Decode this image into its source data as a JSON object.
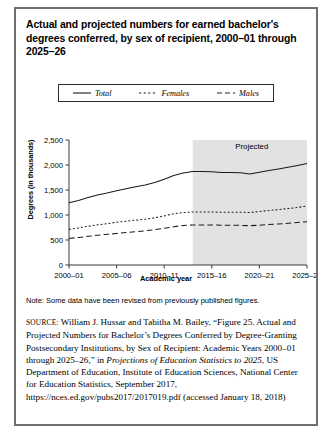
{
  "figure": {
    "title": "Actual and projected numbers for earned bachelor's degrees conferred, by sex of recipient, 2000–01 through 2025–26",
    "note": "Note: Some data have been revised from previously published figures.",
    "source_label": "SOURCE:",
    "source_part1": " William J. Hussar and Tabitha M. Bailey, “Figure 25. Actual and Projected Numbers for Bachelor’s Degrees Conferred by Degree-Granting Postsecondary Institutions, by Sex of Recipient: Academic Years 2000–01 through 2025–26,” in ",
    "source_italic1": "Projections of Education Statistics to 2025",
    "source_part2": ", US Department of Education, Institute of Education Sciences, National Center for Education Statistics, September 2017, https://nces.ed.gov/pubs2017/2017019.pdf (accessed January 18, 2018)"
  },
  "chart_data": {
    "type": "line",
    "title": "Actual and projected numbers for earned bachelor's degrees conferred, by sex of recipient, 2000–01 through 2025–26",
    "xlabel": "Academic year",
    "ylabel": "Degrees (in thousands)",
    "ylim": [
      0,
      2500
    ],
    "yticks": [
      0,
      500,
      1000,
      1500,
      2000,
      2500
    ],
    "ytick_labels": [
      "0",
      "500",
      "1,000",
      "1,500",
      "2,000",
      "2,500"
    ],
    "xticks": [
      2000,
      2005,
      2010,
      2015,
      2020,
      2025
    ],
    "xtick_labels": [
      "2000–01",
      "2005–06",
      "2010–11",
      "2015–16",
      "2020–21",
      "2025–26"
    ],
    "xlim": [
      2000,
      2025
    ],
    "grid": false,
    "legend_position": "top-center",
    "annotations": [
      {
        "text": "Projected",
        "x": 2019.2,
        "y": 2330
      }
    ],
    "shaded_region": {
      "label": "Projected",
      "x_start": 2013,
      "x_end": 2025,
      "color": "#e2e2e2"
    },
    "x": [
      2000,
      2001,
      2002,
      2003,
      2004,
      2005,
      2006,
      2007,
      2008,
      2009,
      2010,
      2011,
      2012,
      2013,
      2014,
      2015,
      2016,
      2017,
      2018,
      2019,
      2020,
      2021,
      2022,
      2023,
      2024,
      2025
    ],
    "series": [
      {
        "name": "Total",
        "style": "solid",
        "values": [
          1244,
          1292,
          1348,
          1399,
          1439,
          1485,
          1524,
          1563,
          1601,
          1650,
          1716,
          1792,
          1840,
          1870,
          1872,
          1866,
          1852,
          1848,
          1843,
          1822,
          1856,
          1888,
          1920,
          1954,
          1992,
          2030
        ]
      },
      {
        "name": "Females",
        "style": "dotted",
        "values": [
          712,
          742,
          775,
          804,
          826,
          855,
          875,
          896,
          917,
          944,
          982,
          1026,
          1049,
          1060,
          1061,
          1059,
          1055,
          1056,
          1057,
          1050,
          1070,
          1089,
          1108,
          1128,
          1152,
          1178
        ]
      },
      {
        "name": "Males",
        "style": "dashed",
        "values": [
          532,
          550,
          573,
          595,
          613,
          630,
          649,
          667,
          684,
          706,
          734,
          766,
          791,
          800,
          802,
          800,
          797,
          795,
          793,
          786,
          796,
          808,
          820,
          834,
          850,
          866
        ]
      }
    ]
  },
  "legend": {
    "items": [
      {
        "label": "Total",
        "style": "solid"
      },
      {
        "label": "Females",
        "style": "dotted"
      },
      {
        "label": "Males",
        "style": "dashed"
      }
    ]
  }
}
